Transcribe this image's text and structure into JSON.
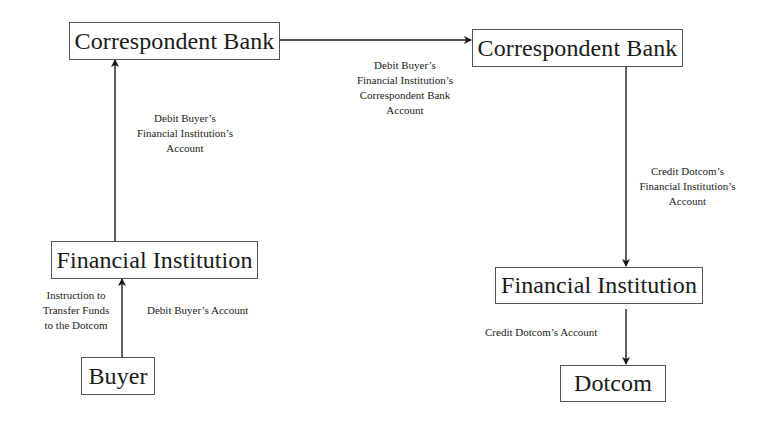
{
  "diagram": {
    "nodes": {
      "correspondent_bank_left": {
        "label": "Correspondent Bank"
      },
      "correspondent_bank_right": {
        "label": "Correspondent Bank"
      },
      "financial_institution_left": {
        "label": "Financial Institution"
      },
      "financial_institution_right": {
        "label": "Financial Institution"
      },
      "buyer": {
        "label": "Buyer"
      },
      "dotcom": {
        "label": "Dotcom"
      }
    },
    "edges": {
      "buyer_to_fi_instruction": {
        "lines": [
          "Instruction to",
          "Transfer Funds",
          "to the Dotcom"
        ]
      },
      "buyer_to_fi_debit": {
        "lines": [
          "Debit Buyer’s Account"
        ]
      },
      "fi_to_cb_left": {
        "lines": [
          "Debit Buyer’s",
          "Financial Institution’s",
          "Account"
        ]
      },
      "cb_to_cb": {
        "lines": [
          "Debit Buyer’s",
          "Financial Institution’s",
          "Correspondent Bank",
          "Account"
        ]
      },
      "cb_to_fi_right": {
        "lines": [
          "Credit Dotcom’s",
          "Financial Institution’s",
          "Account"
        ]
      },
      "fi_to_dotcom": {
        "lines": [
          "Credit Dotcom’s Account"
        ]
      }
    }
  }
}
